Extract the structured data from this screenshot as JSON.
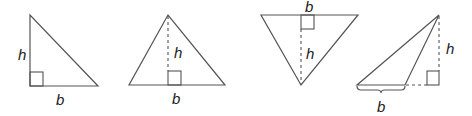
{
  "diagram": {
    "stroke_color": "#555555",
    "label_color": "#222222",
    "triangles": [
      {
        "type": "right-triangle",
        "base_label": "b",
        "height_label": "h"
      },
      {
        "type": "acute-triangle-with-altitude",
        "base_label": "b",
        "height_label": "h"
      },
      {
        "type": "inverted-triangle-with-altitude",
        "base_label": "b",
        "height_label": "h"
      },
      {
        "type": "obtuse-triangle-with-external-altitude",
        "base_label": "b",
        "height_label": "h"
      }
    ]
  }
}
